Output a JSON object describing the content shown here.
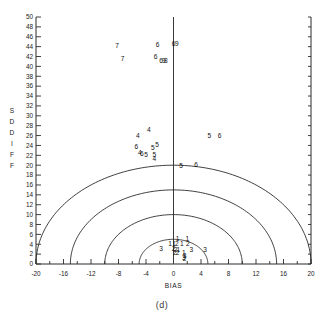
{
  "figure": {
    "caption": "(d)",
    "panel_label": "(d)"
  },
  "chart_data": {
    "type": "scatter",
    "title": "",
    "xlabel": "BIAS",
    "ylabel": "SD DIFF",
    "xlim": [
      -20,
      20
    ],
    "ylim": [
      0,
      50
    ],
    "grid": false,
    "legend": null,
    "xticks": [
      -20,
      -16,
      -12,
      -8,
      -4,
      0,
      4,
      8,
      12,
      16,
      20
    ],
    "xtick_labels": [
      "-20",
      "-16",
      "-12",
      "-8",
      "-4",
      "0",
      "4",
      "8",
      "12",
      "16",
      "20"
    ],
    "xtick_minor_step": 2,
    "yticks": [
      0,
      2,
      4,
      6,
      8,
      10,
      12,
      14,
      16,
      18,
      20,
      22,
      24,
      26,
      28,
      30,
      32,
      34,
      36,
      38,
      40,
      42,
      44,
      46,
      48,
      50
    ],
    "ytick_labels": [
      "0",
      "2",
      "4",
      "6",
      "8",
      "10",
      "12",
      "14",
      "16",
      "18",
      "20",
      "22",
      "24",
      "26",
      "28",
      "30",
      "32",
      "34",
      "36",
      "38",
      "40",
      "42",
      "44",
      "46",
      "48",
      "50"
    ],
    "ylabel_chars": [
      "S",
      "D",
      "D",
      "I",
      "F",
      "F"
    ],
    "marker_style": "group-id-digit",
    "reference_arcs": {
      "description": "semicircles of constant distance from origin",
      "center": [
        0,
        0
      ],
      "radii": [
        5,
        10,
        15,
        20
      ]
    },
    "vertical_reference_line_x": 0,
    "points": [
      {
        "label": "7",
        "x": -8.2,
        "y": 44.3
      },
      {
        "label": "7",
        "x": -7.4,
        "y": 41.5
      },
      {
        "label": "6",
        "x": -2.3,
        "y": 44.5
      },
      {
        "label": "6",
        "x": 0.0,
        "y": 44.6
      },
      {
        "label": "9",
        "x": 0.5,
        "y": 44.6
      },
      {
        "label": "6",
        "x": -2.6,
        "y": 41.9
      },
      {
        "label": "6",
        "x": -1.8,
        "y": 41.2
      },
      {
        "label": "9",
        "x": -1.4,
        "y": 41.2
      },
      {
        "label": "8",
        "x": -1.1,
        "y": 41.2
      },
      {
        "label": "4",
        "x": -3.6,
        "y": 27.3
      },
      {
        "label": "4",
        "x": -5.2,
        "y": 25.9
      },
      {
        "label": "5",
        "x": 5.2,
        "y": 26.0
      },
      {
        "label": "6",
        "x": 6.7,
        "y": 26.0
      },
      {
        "label": "6",
        "x": -5.4,
        "y": 23.8
      },
      {
        "label": "5",
        "x": -2.4,
        "y": 24.2
      },
      {
        "label": "5",
        "x": -3.0,
        "y": 23.6
      },
      {
        "label": "4",
        "x": -4.9,
        "y": 22.5
      },
      {
        "label": "6",
        "x": -4.6,
        "y": 22.4
      },
      {
        "label": "5",
        "x": -4.0,
        "y": 22.1
      },
      {
        "label": "5",
        "x": -2.8,
        "y": 22.1
      },
      {
        "label": "4",
        "x": -2.8,
        "y": 21.4
      },
      {
        "label": "5",
        "x": 1.1,
        "y": 20.0
      },
      {
        "label": "6",
        "x": 3.3,
        "y": 20.1
      },
      {
        "label": "1",
        "x": 0.6,
        "y": 5.2
      },
      {
        "label": "1",
        "x": 2.0,
        "y": 5.1
      },
      {
        "label": "1",
        "x": -0.5,
        "y": 4.2
      },
      {
        "label": "1",
        "x": 0.1,
        "y": 4.2
      },
      {
        "label": "2",
        "x": 0.5,
        "y": 4.2
      },
      {
        "label": "1",
        "x": 1.2,
        "y": 4.1
      },
      {
        "label": "2",
        "x": 2.1,
        "y": 4.1
      },
      {
        "label": "3",
        "x": -1.8,
        "y": 3.1
      },
      {
        "label": "2",
        "x": 0.0,
        "y": 3.2
      },
      {
        "label": "2",
        "x": 0.3,
        "y": 3.0
      },
      {
        "label": "1",
        "x": 0.7,
        "y": 3.0
      },
      {
        "label": "3",
        "x": 2.6,
        "y": 3.0
      },
      {
        "label": "3",
        "x": 4.6,
        "y": 2.9
      },
      {
        "label": "2",
        "x": 0.2,
        "y": 2.4
      },
      {
        "label": "2",
        "x": 0.6,
        "y": 2.3
      },
      {
        "label": "1",
        "x": 1.5,
        "y": 2.3
      },
      {
        "label": "3",
        "x": 1.6,
        "y": 1.8
      },
      {
        "label": "2",
        "x": 1.6,
        "y": 1.1
      },
      {
        "label": "3",
        "x": 1.5,
        "y": 1.2
      }
    ]
  }
}
